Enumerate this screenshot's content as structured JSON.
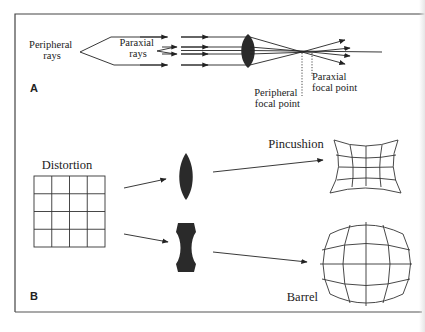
{
  "figure": {
    "panel_a": {
      "label": "A",
      "peripheral_rays_label": [
        "Peripheral",
        "rays"
      ],
      "paraxial_rays_label": [
        "Paraxial",
        "rays"
      ],
      "peripheral_focal_point_label": [
        "Peripheral",
        "focal point"
      ],
      "paraxial_focal_point_label": [
        "Paraxial",
        "focal point"
      ]
    },
    "panel_b": {
      "label": "B",
      "distortion_label": "Distortion",
      "pincushion_label": "Pincushion",
      "barrel_label": "Barrel"
    },
    "colors": {
      "ink": "#222222",
      "lens_fill": "#2a2a2a",
      "border": "#444444",
      "background": "#ffffff"
    }
  }
}
